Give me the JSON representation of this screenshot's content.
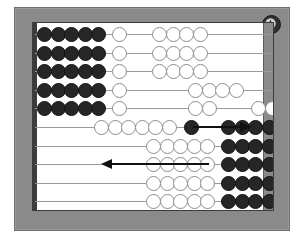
{
  "figure": {
    "frame_color": "#8a8a8a",
    "board_color": "#ffffff",
    "bead_black": "#262626",
    "bead_white": "#ffffff",
    "rod_color": "#9a9a9a",
    "arrow_color": "#111111"
  },
  "logo": {
    "name": "circular-badge-logo",
    "label": "A"
  },
  "abacus": {
    "row_count": 10,
    "beads_per_row": 10,
    "rows": [
      {
        "index": 1,
        "label": "row-1",
        "groups": [
          {
            "color": "black",
            "count": 5,
            "x": 4
          },
          {
            "color": "white",
            "count": 1,
            "x": 79
          },
          {
            "color": "white",
            "count": 4,
            "x": 119
          }
        ]
      },
      {
        "index": 2,
        "label": "row-2",
        "groups": [
          {
            "color": "black",
            "count": 5,
            "x": 4
          },
          {
            "color": "white",
            "count": 1,
            "x": 79
          },
          {
            "color": "white",
            "count": 4,
            "x": 119
          }
        ]
      },
      {
        "index": 3,
        "label": "row-3",
        "groups": [
          {
            "color": "black",
            "count": 5,
            "x": 4
          },
          {
            "color": "white",
            "count": 1,
            "x": 79
          },
          {
            "color": "white",
            "count": 4,
            "x": 119
          }
        ]
      },
      {
        "index": 4,
        "label": "row-4",
        "groups": [
          {
            "color": "black",
            "count": 5,
            "x": 4
          },
          {
            "color": "white",
            "count": 1,
            "x": 79
          },
          {
            "color": "white",
            "count": 4,
            "x": 155
          }
        ]
      },
      {
        "index": 5,
        "label": "row-5",
        "groups": [
          {
            "color": "black",
            "count": 5,
            "x": 4
          },
          {
            "color": "white",
            "count": 1,
            "x": 79
          },
          {
            "color": "white",
            "count": 2,
            "x": 155
          },
          {
            "color": "white",
            "count": 2,
            "x": 218
          }
        ]
      },
      {
        "index": 6,
        "label": "row-6",
        "groups": [
          {
            "color": "white",
            "count": 6,
            "x": 61
          },
          {
            "color": "black",
            "count": 1,
            "x": 151
          },
          {
            "color": "black",
            "count": 5,
            "x": 188
          }
        ]
      },
      {
        "index": 7,
        "label": "row-7",
        "groups": [
          {
            "color": "white",
            "count": 5,
            "x": 113
          },
          {
            "color": "black",
            "count": 5,
            "x": 188
          }
        ]
      },
      {
        "index": 8,
        "label": "row-8",
        "groups": [
          {
            "color": "white",
            "count": 5,
            "x": 113
          },
          {
            "color": "black",
            "count": 5,
            "x": 188
          }
        ]
      },
      {
        "index": 9,
        "label": "row-9",
        "groups": [
          {
            "color": "white",
            "count": 5,
            "x": 113
          },
          {
            "color": "black",
            "count": 5,
            "x": 188
          }
        ]
      },
      {
        "index": 10,
        "label": "row-10",
        "groups": [
          {
            "color": "white",
            "count": 5,
            "x": 113
          },
          {
            "color": "black",
            "count": 5,
            "x": 188
          }
        ]
      }
    ]
  },
  "annotations": {
    "arrows": [
      {
        "name": "arrow-right",
        "direction": "right",
        "x": 160,
        "y": 104,
        "length": 58,
        "meaning": "beads moved to the right"
      },
      {
        "name": "arrow-left",
        "direction": "left",
        "x": 76,
        "y": 141,
        "length": 96,
        "meaning": "beads moved to the left"
      }
    ]
  }
}
